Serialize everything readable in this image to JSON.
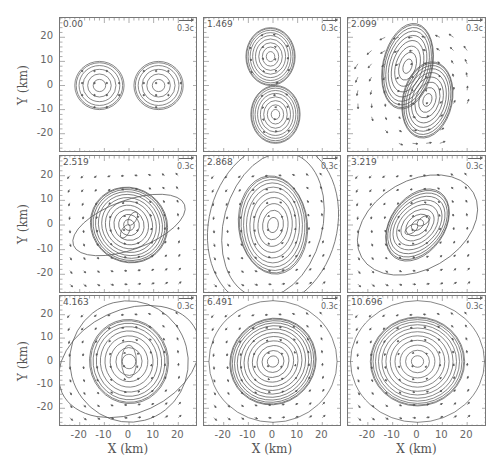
{
  "figure": {
    "axis_label_y": "Y (km)",
    "axis_label_x": "X (km)",
    "y_ticks": [
      "20",
      "10",
      "0",
      "-10",
      "-20"
    ],
    "x_ticks": [
      "-20",
      "-10",
      "0",
      "10",
      "20"
    ],
    "velocity_scale_label": "0.3c",
    "colors": {
      "line": "#555555",
      "frame": "#777777",
      "text": "#555555",
      "background": "#ffffff"
    }
  },
  "panels": [
    {
      "time": "0.00",
      "row": 0,
      "col": 0,
      "scale": "0.3c"
    },
    {
      "time": "1.469",
      "row": 0,
      "col": 1,
      "scale": "0.3c"
    },
    {
      "time": "2.099",
      "row": 0,
      "col": 2,
      "scale": "0.3c"
    },
    {
      "time": "2.519",
      "row": 1,
      "col": 0,
      "scale": "0.3c"
    },
    {
      "time": "2.868",
      "row": 1,
      "col": 1,
      "scale": "0.3c"
    },
    {
      "time": "3.219",
      "row": 1,
      "col": 2,
      "scale": "0.3c"
    },
    {
      "time": "4.163",
      "row": 2,
      "col": 0,
      "scale": "0.3c"
    },
    {
      "time": "6.491",
      "row": 2,
      "col": 1,
      "scale": "0.3c"
    },
    {
      "time": "10.696",
      "row": 2,
      "col": 2,
      "scale": "0.3c"
    }
  ],
  "chart_data": {
    "type": "contour+vector",
    "title": "",
    "xlabel": "X (km)",
    "ylabel": "Y (km)",
    "xlim": [
      -28,
      28
    ],
    "ylim": [
      -28,
      28
    ],
    "x_ticks": [
      -20,
      -10,
      0,
      10,
      20
    ],
    "y_ticks": [
      -20,
      -10,
      0,
      10,
      20
    ],
    "grid": false,
    "layout": {
      "rows": 3,
      "cols": 3,
      "shared_axes": true
    },
    "velocity_reference_arrow": "0.3c",
    "panels": [
      {
        "time": 0.0,
        "description": "Two separated spherical stars centered at (-12,0) and (12,0), radius ~10 km, nearly static radial vectors"
      },
      {
        "time": 1.469,
        "description": "Two stars rotated to vertical alignment at (0,12) and (0,-12), touching, tidal distortion"
      },
      {
        "time": 2.099,
        "description": "Merging elongated double-core structure, tilted, with shed material and outflow vectors"
      },
      {
        "time": 2.519,
        "description": "Central merged core with two peaks, spiral arms, rotating velocity field"
      },
      {
        "time": 2.868,
        "description": "Elongated vertically extended remnant, oval core, broad rotational flow"
      },
      {
        "time": 3.219,
        "description": "Bar-like core tilted, double-peaked, spiral arms"
      },
      {
        "time": 4.163,
        "description": "Peanut-shaped central core, concentric contours, strong rotation"
      },
      {
        "time": 6.491,
        "description": "Nearly axisymmetric remnant with slight elongated core at ~45 deg"
      },
      {
        "time": 10.696,
        "description": "Axisymmetric differentially rotating remnant, concentric circular contours"
      }
    ]
  }
}
